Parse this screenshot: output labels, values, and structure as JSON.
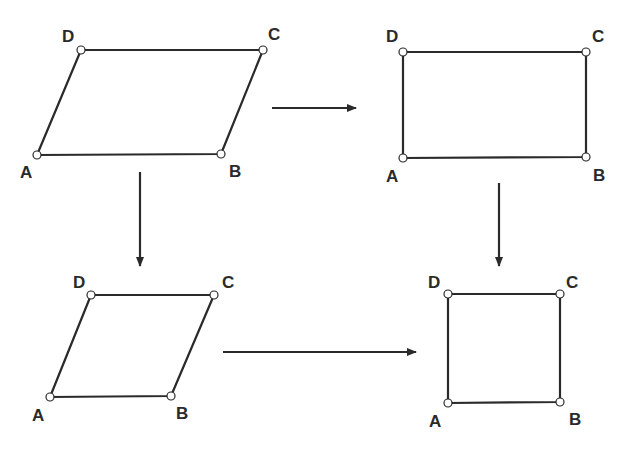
{
  "colors": {
    "stroke": "#2a2a2a",
    "vertex_fill": "#ffffff",
    "background": "#ffffff"
  },
  "shapes": [
    {
      "name": "parallelogram",
      "vertices": {
        "A": [
          37,
          155
        ],
        "B": [
          221,
          154
        ],
        "C": [
          263,
          50
        ],
        "D": [
          81,
          50
        ]
      },
      "labels": {
        "A": "A",
        "B": "B",
        "C": "C",
        "D": "D"
      },
      "label_pos": {
        "A": [
          20,
          178
        ],
        "B": [
          229,
          177
        ],
        "C": [
          268,
          40
        ],
        "D": [
          62,
          42
        ]
      }
    },
    {
      "name": "rectangle",
      "vertices": {
        "A": [
          403,
          158
        ],
        "B": [
          586,
          157
        ],
        "C": [
          586,
          52
        ],
        "D": [
          403,
          52
        ]
      },
      "labels": {
        "A": "A",
        "B": "B",
        "C": "C",
        "D": "D"
      },
      "label_pos": {
        "A": [
          386,
          182
        ],
        "B": [
          593,
          181
        ],
        "C": [
          592,
          42
        ],
        "D": [
          386,
          42
        ]
      }
    },
    {
      "name": "rhombus",
      "vertices": {
        "A": [
          50,
          397
        ],
        "B": [
          171,
          396
        ],
        "C": [
          214,
          295
        ],
        "D": [
          91,
          295
        ]
      },
      "labels": {
        "A": "A",
        "B": "B",
        "C": "C",
        "D": "D"
      },
      "label_pos": {
        "A": [
          32,
          421
        ],
        "B": [
          176,
          419
        ],
        "C": [
          222,
          288
        ],
        "D": [
          73,
          288
        ]
      }
    },
    {
      "name": "square",
      "vertices": {
        "A": [
          448,
          403
        ],
        "B": [
          560,
          402
        ],
        "C": [
          560,
          294
        ],
        "D": [
          448,
          294
        ]
      },
      "labels": {
        "A": "A",
        "B": "B",
        "C": "C",
        "D": "D"
      },
      "label_pos": {
        "A": [
          429,
          427
        ],
        "B": [
          569,
          425
        ],
        "C": [
          566,
          288
        ],
        "D": [
          428,
          288
        ]
      }
    }
  ],
  "arrows": [
    {
      "name": "parallelogram-to-rectangle",
      "from": [
        272,
        108
      ],
      "to": [
        356,
        108
      ]
    },
    {
      "name": "parallelogram-to-rhombus",
      "from": [
        140,
        172
      ],
      "to": [
        140,
        266
      ]
    },
    {
      "name": "rectangle-to-square",
      "from": [
        499,
        183
      ],
      "to": [
        499,
        266
      ]
    },
    {
      "name": "rhombus-to-square",
      "from": [
        223,
        352
      ],
      "to": [
        416,
        352
      ]
    }
  ]
}
